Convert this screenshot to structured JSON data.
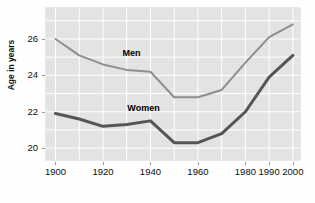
{
  "chart_data": {
    "type": "line",
    "title": "",
    "xlabel": "",
    "ylabel": "Age in years",
    "xlim": [
      1896,
      2003
    ],
    "ylim": [
      19.35,
      27.7
    ],
    "grid": true,
    "grid_color": "#ffffff",
    "plot_background": "#e3e3e3",
    "legend": "inline-labels",
    "x_tick_labels": [
      "1900",
      "1920",
      "1940",
      "1960",
      "1980",
      "1990",
      "2000"
    ],
    "x_tick_values": [
      1900,
      1920,
      1940,
      1960,
      1980,
      1990,
      2000
    ],
    "x_gridline_values": [
      1900,
      1910,
      1920,
      1930,
      1940,
      1950,
      1960,
      1970,
      1980,
      1990,
      2000
    ],
    "y_tick_labels": [
      "20",
      "22",
      "24",
      "26"
    ],
    "y_tick_values": [
      20,
      22,
      24,
      26
    ],
    "y_gridline_values": [
      20,
      21,
      22,
      23,
      24,
      25,
      26,
      27
    ],
    "series": [
      {
        "name": "Men",
        "color": "#8e8e8e",
        "width": 2.0,
        "label_text": "Men",
        "x": [
          1900,
          1910,
          1920,
          1930,
          1940,
          1950,
          1960,
          1970,
          1980,
          1990,
          2000
        ],
        "values": [
          26.0,
          25.1,
          24.6,
          24.3,
          24.2,
          22.8,
          22.8,
          23.2,
          24.7,
          26.1,
          26.8
        ]
      },
      {
        "name": "Women",
        "color": "#555555",
        "width": 3.0,
        "label_text": "Women",
        "x": [
          1900,
          1910,
          1920,
          1930,
          1940,
          1950,
          1960,
          1970,
          1980,
          1990,
          2000
        ],
        "values": [
          21.9,
          21.6,
          21.2,
          21.3,
          21.5,
          20.3,
          20.3,
          20.8,
          22.0,
          23.9,
          25.1
        ]
      }
    ]
  }
}
